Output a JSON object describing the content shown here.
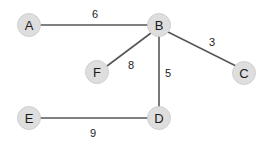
{
  "diagram": {
    "type": "weighted-undirected-graph",
    "background_color": "#ffffff",
    "node_fill_color": "#dedede",
    "node_stroke_color": "#c8c8c8",
    "edge_color": "#555759",
    "text_color": "#1a1a1a",
    "nodes": [
      {
        "id": "A",
        "label": "A",
        "cx": 29,
        "cy": 25,
        "r": 11.5
      },
      {
        "id": "B",
        "label": "B",
        "cx": 159,
        "cy": 25,
        "r": 11.5
      },
      {
        "id": "C",
        "label": "C",
        "cx": 244,
        "cy": 73,
        "r": 11.5
      },
      {
        "id": "D",
        "label": "D",
        "cx": 159,
        "cy": 118,
        "r": 11.5
      },
      {
        "id": "E",
        "label": "E",
        "cx": 29,
        "cy": 118,
        "r": 11.5
      },
      {
        "id": "F",
        "label": "F",
        "cx": 97,
        "cy": 72,
        "r": 11.5
      }
    ],
    "edges": [
      {
        "from": "A",
        "to": "B",
        "weight": "6",
        "x1": 40.5,
        "y1": 25,
        "x2": 147.5,
        "y2": 25,
        "lx": 95,
        "ly": 14
      },
      {
        "from": "B",
        "to": "C",
        "weight": "3",
        "x1": 168,
        "y1": 32,
        "x2": 236,
        "y2": 66,
        "lx": 212,
        "ly": 42
      },
      {
        "from": "B",
        "to": "F",
        "weight": "8",
        "x1": 151,
        "y1": 33,
        "x2": 107,
        "y2": 66,
        "lx": 131,
        "ly": 65
      },
      {
        "from": "B",
        "to": "D",
        "weight": "5",
        "x1": 159,
        "y1": 36.5,
        "x2": 159,
        "y2": 106.5,
        "lx": 168,
        "ly": 73
      },
      {
        "from": "E",
        "to": "D",
        "weight": "9",
        "x1": 40.5,
        "y1": 118,
        "x2": 147.5,
        "y2": 118,
        "lx": 93,
        "ly": 133
      }
    ]
  }
}
